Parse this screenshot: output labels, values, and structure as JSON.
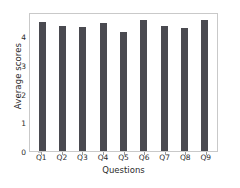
{
  "chart_data": {
    "type": "bar",
    "title": "",
    "xlabel": "Questions",
    "ylabel": "Average scores",
    "categories": [
      "Q1",
      "Q2",
      "Q3",
      "Q4",
      "Q5",
      "Q6",
      "Q7",
      "Q8",
      "Q9"
    ],
    "values": [
      4.55,
      4.44,
      4.38,
      4.52,
      4.21,
      4.65,
      4.41,
      4.34,
      4.65
    ],
    "ylim": [
      0,
      4.85
    ],
    "yticks": [
      0,
      1,
      2,
      3,
      4
    ],
    "ytick_labels": [
      "0",
      "1",
      "2",
      "3",
      "4"
    ],
    "grid": false,
    "legend": null,
    "bar_color": "#4a4a50",
    "axes_edge_color": "#c9c9c9",
    "background_color": "#ffffff"
  }
}
